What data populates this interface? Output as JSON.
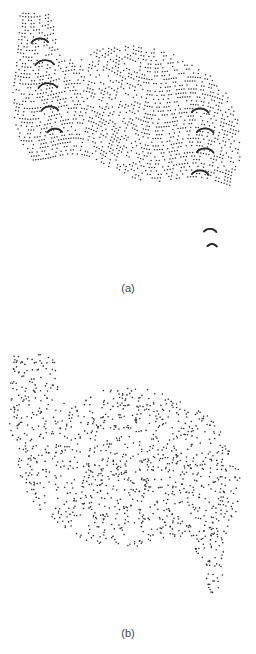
{
  "figure": {
    "panels": [
      {
        "id": "a",
        "label": "(a)",
        "pattern": "structured-swirl",
        "point_count": 1500,
        "dot_color": "#2b2b2b",
        "dot_radius": 0.75
      },
      {
        "id": "b",
        "label": "(b)",
        "pattern": "uniform-random",
        "point_count": 1200,
        "dot_color": "#2b2b2b",
        "dot_radius": 0.8
      }
    ]
  },
  "chart_data": [
    {
      "type": "scatter",
      "title": "(a)",
      "description": "Point set filling an S/hook-shaped region; points arranged in regular curved streaks (swirl / low-discrepancy lattice pattern) with dark arc-shaped clusters near the left and right lobes.",
      "xlabel": "",
      "ylabel": "",
      "grid": false,
      "axes": false,
      "legend": null
    },
    {
      "type": "scatter",
      "title": "(b)",
      "description": "Same S/hook-shaped region filled with uniformly random (unstructured) points.",
      "xlabel": "",
      "ylabel": "",
      "grid": false,
      "axes": false,
      "legend": null
    }
  ]
}
